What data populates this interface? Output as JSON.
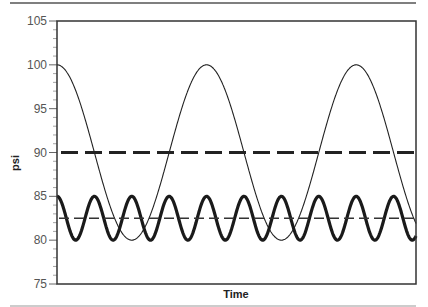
{
  "chart_data": {
    "type": "line",
    "title": "",
    "xlabel": "Time",
    "ylabel": "psi",
    "ylim": [
      75,
      105
    ],
    "yticks": [
      75,
      80,
      85,
      90,
      95,
      100,
      105
    ],
    "grid": false,
    "legend": null,
    "series": [
      {
        "name": "slow-oscillation",
        "style": "solid-thin",
        "mean": 90,
        "amplitude": 10,
        "min": 80,
        "max": 100,
        "cycles_shown": 2.4,
        "starts_at": 100
      },
      {
        "name": "slow-mean",
        "style": "dashed-thick",
        "value": 90
      },
      {
        "name": "fast-oscillation",
        "style": "solid-thick",
        "mean": 82.5,
        "amplitude": 2.5,
        "min": 80,
        "max": 85,
        "cycles_shown": 9.6,
        "starts_at": 85
      },
      {
        "name": "fast-mean",
        "style": "dashed-thin",
        "value": 82.5
      }
    ]
  },
  "axes": {
    "x_title": "Time",
    "y_title": "psi",
    "y_tick_labels": [
      "75",
      "80",
      "85",
      "90",
      "95",
      "100",
      "105"
    ]
  },
  "colors": {
    "line": "#222222",
    "axis": "#333333",
    "rule": "#666666"
  }
}
